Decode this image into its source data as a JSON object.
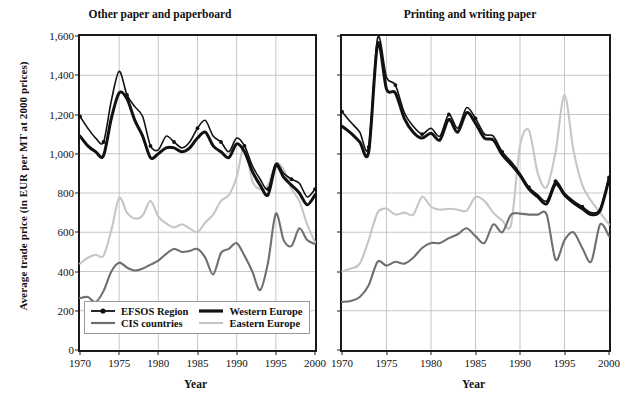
{
  "axis": {
    "ylabel": "Average trade price (in EUR per MT at 2000 prices)",
    "xlabel": "Year",
    "yticks": [
      "0",
      "200",
      "400",
      "600",
      "800",
      "1,000",
      "1,200",
      "1,400",
      "1,600"
    ],
    "xticks": [
      "1970",
      "1975",
      "1980",
      "1985",
      "1990",
      "1995",
      "2000"
    ]
  },
  "legend": {
    "items": [
      {
        "label": "EFSOS Region",
        "key": "efsos",
        "color": "#111111"
      },
      {
        "label": "Western Europe",
        "key": "we",
        "color": "#111111"
      },
      {
        "label": "CIS countries",
        "key": "cis",
        "color": "#6f6f6f"
      },
      {
        "label": "Eastern Europe",
        "key": "eastern",
        "color": "#c6c6c6"
      }
    ]
  },
  "chart_data": [
    {
      "type": "line",
      "title": "Other paper and paperboard",
      "xlabel": "Year",
      "ylabel": "Average trade price (in EUR per MT at 2000 prices)",
      "xlim": [
        1970,
        2000
      ],
      "ylim": [
        0,
        1600
      ],
      "grid": true,
      "legend_position": "bottom-left",
      "x": [
        1970,
        1971,
        1972,
        1973,
        1974,
        1975,
        1976,
        1977,
        1978,
        1979,
        1980,
        1981,
        1982,
        1983,
        1984,
        1985,
        1986,
        1987,
        1988,
        1989,
        1990,
        1991,
        1992,
        1993,
        1994,
        1995,
        1996,
        1997,
        1998,
        1999,
        2000
      ],
      "series": [
        {
          "name": "EFSOS Region",
          "values": [
            1190,
            1130,
            1080,
            1060,
            1270,
            1420,
            1300,
            1240,
            1190,
            1040,
            1020,
            1090,
            1060,
            1030,
            1060,
            1130,
            1170,
            1090,
            1060,
            1010,
            1080,
            1040,
            940,
            870,
            820,
            950,
            900,
            870,
            850,
            780,
            820
          ]
        },
        {
          "name": "Western Europe",
          "values": [
            1090,
            1040,
            1010,
            990,
            1180,
            1310,
            1280,
            1170,
            1090,
            980,
            1000,
            1030,
            1030,
            1010,
            1030,
            1080,
            1110,
            1040,
            1010,
            980,
            1050,
            1010,
            910,
            840,
            790,
            940,
            880,
            840,
            800,
            740,
            790
          ]
        },
        {
          "name": "CIS countries",
          "values": [
            265,
            270,
            245,
            300,
            400,
            445,
            420,
            405,
            415,
            435,
            455,
            490,
            515,
            500,
            505,
            515,
            470,
            385,
            495,
            515,
            545,
            480,
            400,
            305,
            445,
            695,
            560,
            530,
            620,
            560,
            540
          ]
        },
        {
          "name": "Eastern Europe",
          "values": [
            440,
            470,
            485,
            480,
            610,
            775,
            700,
            670,
            685,
            760,
            680,
            645,
            625,
            640,
            620,
            600,
            650,
            690,
            760,
            790,
            880,
            1045,
            860,
            820,
            840,
            950,
            920,
            820,
            760,
            640,
            550
          ]
        }
      ]
    },
    {
      "type": "line",
      "title": "Printing and writing paper",
      "xlabel": "Year",
      "ylabel": "Average trade price (in EUR per MT at 2000 prices)",
      "xlim": [
        1970,
        2000
      ],
      "ylim": [
        0,
        1600
      ],
      "grid": true,
      "legend_position": "none",
      "x": [
        1970,
        1971,
        1972,
        1973,
        1974,
        1975,
        1976,
        1977,
        1978,
        1979,
        1980,
        1981,
        1982,
        1983,
        1984,
        1985,
        1986,
        1987,
        1988,
        1989,
        1990,
        1991,
        1992,
        1993,
        1994,
        1995,
        1996,
        1997,
        1998,
        1999,
        2000
      ],
      "series": [
        {
          "name": "EFSOS Region",
          "values": [
            1215,
            1160,
            1110,
            1035,
            1590,
            1390,
            1350,
            1210,
            1140,
            1100,
            1130,
            1090,
            1200,
            1130,
            1235,
            1180,
            1100,
            1090,
            1010,
            960,
            900,
            830,
            790,
            760,
            860,
            800,
            760,
            730,
            700,
            720,
            880
          ]
        },
        {
          "name": "Western Europe",
          "values": [
            1140,
            1105,
            1060,
            1010,
            1560,
            1330,
            1310,
            1180,
            1110,
            1080,
            1105,
            1070,
            1175,
            1110,
            1210,
            1155,
            1080,
            1070,
            995,
            945,
            890,
            820,
            780,
            745,
            845,
            790,
            750,
            720,
            690,
            710,
            870
          ]
        },
        {
          "name": "CIS countries",
          "values": [
            245,
            250,
            270,
            330,
            450,
            430,
            450,
            440,
            470,
            520,
            545,
            545,
            570,
            590,
            620,
            580,
            545,
            640,
            600,
            690,
            695,
            690,
            690,
            690,
            460,
            560,
            600,
            520,
            450,
            640,
            580
          ]
        },
        {
          "name": "Eastern Europe",
          "values": [
            400,
            415,
            440,
            560,
            700,
            720,
            690,
            700,
            690,
            780,
            730,
            715,
            720,
            715,
            710,
            780,
            760,
            700,
            660,
            640,
            1040,
            1120,
            900,
            830,
            1010,
            1300,
            1020,
            840,
            760,
            700,
            640
          ]
        }
      ]
    }
  ]
}
